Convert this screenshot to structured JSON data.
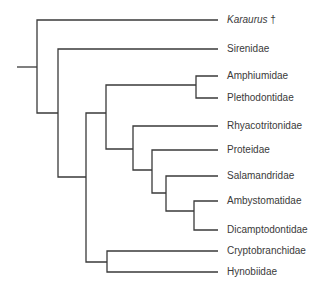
{
  "diagram": {
    "type": "cladogram",
    "colors": {
      "line": "#3a3a3a",
      "text": "#3a3a3a",
      "background": "#ffffff"
    },
    "taxa": [
      {
        "name": "Karaurus",
        "suffix": "†",
        "extinct": true,
        "y": 20
      },
      {
        "name": "Sirenidae",
        "y": 49
      },
      {
        "name": "Amphiumidae",
        "y": 76
      },
      {
        "name": "Plethodontidae",
        "y": 98
      },
      {
        "name": "Rhyacotritonidae",
        "y": 126
      },
      {
        "name": "Proteidae",
        "y": 150
      },
      {
        "name": "Salamandridae",
        "y": 176
      },
      {
        "name": "Ambystomatidae",
        "y": 201
      },
      {
        "name": "Dicamptodontidae",
        "y": 230
      },
      {
        "name": "Cryptobranchidae",
        "y": 251
      },
      {
        "name": "Hynobiidae",
        "y": 272
      }
    ],
    "topology": "(Karaurus†,(Sirenidae,(((Amphiumidae,Plethodontidae),(Rhyacotritonidae,(Proteidae,(Salamandridae,(Ambystomatidae,Dicamptodontidae))))),(Cryptobranchidae,Hynobiidae))))"
  }
}
